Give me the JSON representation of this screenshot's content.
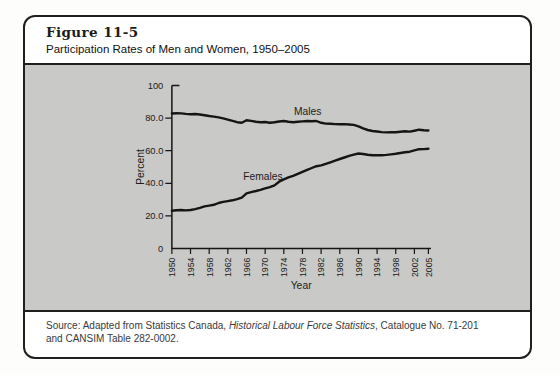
{
  "figure": {
    "label": "Figure 11-5",
    "title": "Participation Rates of Men and Women, 1950–2005"
  },
  "source": {
    "prefix": "Source: Adapted from Statistics Canada, ",
    "italic": "Historical Labour Force Statistics",
    "suffix": ", Catalogue No. 71-201",
    "line2": "and CANSIM Table 282-0002."
  },
  "colors": {
    "band": "#c9c9c7",
    "border": "#1f1f1f",
    "line": "#151515",
    "chart_text": "#1c1c1c"
  },
  "chart_data": {
    "type": "line",
    "title": "Participation Rates of Men and Women, 1950–2005",
    "xlabel": "Year",
    "ylabel": "Percent",
    "xlim": [
      1950,
      2005
    ],
    "ylim": [
      0,
      100
    ],
    "grid": false,
    "legend_position": "inline-labels",
    "x_tick_years": [
      1950,
      1954,
      1958,
      1962,
      1966,
      1970,
      1974,
      1978,
      1982,
      1986,
      1990,
      1994,
      1998,
      2002,
      2005
    ],
    "y_tick_values": [
      0,
      20,
      40,
      60,
      80,
      100
    ],
    "y_tick_labels": [
      "0",
      "20.0",
      "40.0",
      "60.0",
      "80.0",
      "100"
    ],
    "x": [
      1950,
      1951,
      1952,
      1953,
      1954,
      1955,
      1956,
      1957,
      1958,
      1959,
      1960,
      1961,
      1962,
      1963,
      1964,
      1965,
      1966,
      1967,
      1968,
      1969,
      1970,
      1971,
      1972,
      1973,
      1974,
      1975,
      1976,
      1977,
      1978,
      1979,
      1980,
      1981,
      1982,
      1983,
      1984,
      1985,
      1986,
      1987,
      1988,
      1989,
      1990,
      1991,
      1992,
      1993,
      1994,
      1995,
      1996,
      1997,
      1998,
      1999,
      2000,
      2001,
      2002,
      2003,
      2004,
      2005
    ],
    "series": [
      {
        "name": "Males",
        "values": [
          82.8,
          83.0,
          82.9,
          82.6,
          82.4,
          82.5,
          82.2,
          81.8,
          81.3,
          80.9,
          80.4,
          79.8,
          79.1,
          78.3,
          77.5,
          77.2,
          78.7,
          78.3,
          77.8,
          77.4,
          77.6,
          77.2,
          77.4,
          77.9,
          78.2,
          77.7,
          77.4,
          77.7,
          78.0,
          78.2,
          78.1,
          78.2,
          77.1,
          76.6,
          76.5,
          76.3,
          76.2,
          76.3,
          76.1,
          75.8,
          74.9,
          73.7,
          72.7,
          72.1,
          71.8,
          71.4,
          71.2,
          71.4,
          71.3,
          71.6,
          71.9,
          71.7,
          72.3,
          72.9,
          72.5,
          72.4
        ]
      },
      {
        "name": "Females",
        "values": [
          23.2,
          23.5,
          23.6,
          23.4,
          23.6,
          24.2,
          24.9,
          25.8,
          26.3,
          26.8,
          27.9,
          28.6,
          29.1,
          29.6,
          30.3,
          31.2,
          33.8,
          34.6,
          35.3,
          36.0,
          36.9,
          37.6,
          38.7,
          41.0,
          42.4,
          43.6,
          44.6,
          45.8,
          47.0,
          48.2,
          49.4,
          50.5,
          51.0,
          51.9,
          52.9,
          53.9,
          54.9,
          55.8,
          56.8,
          57.6,
          58.3,
          58.0,
          57.5,
          57.2,
          57.3,
          57.2,
          57.4,
          57.7,
          58.1,
          58.6,
          59.0,
          59.4,
          60.2,
          60.9,
          61.0,
          61.2
        ]
      }
    ]
  }
}
